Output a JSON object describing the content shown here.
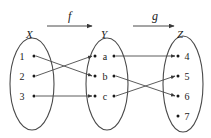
{
  "figure": {
    "background": "#ffffff",
    "ink_color": "#4a4a4a",
    "text_color": "#1a1a1a"
  },
  "sets": [
    {
      "id": "X",
      "label": "X",
      "cx": 32,
      "cy": 84,
      "rx": 22,
      "ry": 46,
      "label_x": 26,
      "label_y": 38,
      "elements": [
        {
          "label": "1",
          "text_x": 22,
          "text_y": 60,
          "dot_x": 34,
          "dot_y": 56
        },
        {
          "label": "2",
          "text_x": 22,
          "text_y": 80,
          "dot_x": 34,
          "dot_y": 76
        },
        {
          "label": "3",
          "text_x": 22,
          "text_y": 100,
          "dot_x": 34,
          "dot_y": 96
        }
      ]
    },
    {
      "id": "Y",
      "label": "Y",
      "cx": 107,
      "cy": 84,
      "rx": 21,
      "ry": 46,
      "label_x": 101,
      "label_y": 38,
      "elements": [
        {
          "label": "a",
          "text_x": 102,
          "text_y": 60,
          "dot_x": 95,
          "dot_y": 56,
          "out_dot_x": 114,
          "out_dot_y": 56
        },
        {
          "label": "b",
          "text_x": 102,
          "text_y": 80,
          "dot_x": 95,
          "dot_y": 76,
          "out_dot_x": 114,
          "out_dot_y": 76
        },
        {
          "label": "c",
          "text_x": 102,
          "text_y": 100,
          "dot_x": 95,
          "dot_y": 96,
          "out_dot_x": 114,
          "out_dot_y": 96
        }
      ]
    },
    {
      "id": "Z",
      "label": "Z",
      "cx": 183,
      "cy": 84,
      "rx": 20,
      "ry": 48,
      "label_x": 177,
      "label_y": 38,
      "elements": [
        {
          "label": "4",
          "text_x": 186,
          "text_y": 60,
          "dot_x": 178,
          "dot_y": 56
        },
        {
          "label": "5",
          "text_x": 186,
          "text_y": 80,
          "dot_x": 178,
          "dot_y": 76
        },
        {
          "label": "6",
          "text_x": 186,
          "text_y": 100,
          "dot_x": 178,
          "dot_y": 96
        },
        {
          "label": "7",
          "text_x": 186,
          "text_y": 120,
          "dot_x": 178,
          "dot_y": 116
        }
      ]
    }
  ],
  "maps": [
    {
      "name": "f",
      "label": "f",
      "label_x": 68,
      "label_y": 20,
      "from": "X",
      "to": "Y",
      "arrow_x1": 47,
      "arrow_x2": 92,
      "arrow_y": 26
    },
    {
      "name": "g",
      "label": "g",
      "label_x": 152,
      "label_y": 20,
      "from": "Y",
      "to": "Z",
      "arrow_x1": 133,
      "arrow_x2": 174,
      "arrow_y": 26
    }
  ],
  "edges": [
    {
      "map": "f",
      "from": "1",
      "to": "b",
      "x1": 36,
      "y1": 56,
      "x2": 92,
      "y2": 76
    },
    {
      "map": "f",
      "from": "2",
      "to": "a",
      "x1": 36,
      "y1": 76,
      "x2": 92,
      "y2": 56
    },
    {
      "map": "f",
      "from": "3",
      "to": "c",
      "x1": 36,
      "y1": 96,
      "x2": 92,
      "y2": 96
    },
    {
      "map": "g",
      "from": "a",
      "to": "4",
      "x1": 116,
      "y1": 56,
      "x2": 175,
      "y2": 56
    },
    {
      "map": "g",
      "from": "b",
      "to": "6",
      "x1": 116,
      "y1": 76,
      "x2": 175,
      "y2": 96
    },
    {
      "map": "g",
      "from": "c",
      "to": "5",
      "x1": 116,
      "y1": 96,
      "x2": 175,
      "y2": 76
    }
  ],
  "unmapped_elements": [
    "7"
  ]
}
